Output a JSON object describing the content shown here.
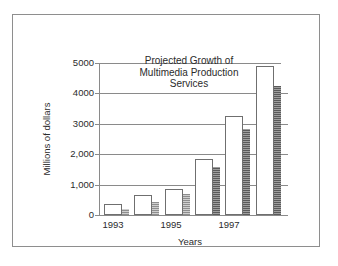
{
  "chart_data": {
    "type": "bar",
    "title": "Projected Growth of Multimedia Production Services",
    "title_lines": [
      "Projected Growth of",
      "Multimedia Production",
      "Services"
    ],
    "xlabel": "Years",
    "ylabel": "Millions of dollars",
    "categories": [
      "1993",
      "1994",
      "1995",
      "1996",
      "1997",
      "1998"
    ],
    "tick_labels_x": [
      "1993",
      "1995",
      "1997"
    ],
    "values": [
      350,
      660,
      860,
      1850,
      3250,
      4900
    ],
    "series": [
      {
        "name": "Projected revenue",
        "values": [
          350,
          660,
          860,
          1850,
          3250,
          4900
        ]
      }
    ],
    "shadow_values": [
      190,
      430,
      690,
      1580,
      2830,
      4250
    ],
    "ylim": [
      0,
      5000
    ],
    "yticks": [
      0,
      1000,
      2000,
      3000,
      4000,
      5000
    ],
    "ytick_labels": [
      "0",
      "1,000",
      "2,000",
      "3000",
      "4000",
      "5000"
    ],
    "grid": true,
    "legend": "none"
  },
  "figure": {
    "frame_color": "#8e8e8e",
    "axis_color": "#8a8a8a",
    "bar_edge_color": "#6f6f6f",
    "bar_fill_color": "#ffffff",
    "shadow_color": "#8d8d8d",
    "text_color": "#2b2b2b",
    "background": "#ffffff"
  }
}
